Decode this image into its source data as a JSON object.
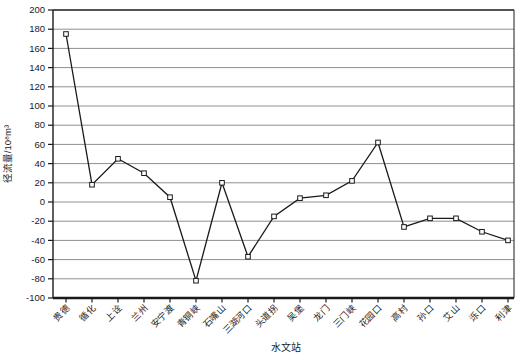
{
  "figure": {
    "background": "#ffffff"
  },
  "chart_data": {
    "type": "line",
    "title": "",
    "xlabel": "水文站",
    "ylabel": "径流量/10⁸m³",
    "categories": [
      "贵德",
      "循化",
      "上诠",
      "兰州",
      "安宁渡",
      "青铜峡",
      "石嘴山",
      "三湖河口",
      "头道拐",
      "吴堡",
      "龙门",
      "三门峡",
      "花园口",
      "高村",
      "孙口",
      "艾山",
      "泺口",
      "利津"
    ],
    "values": [
      175,
      18,
      45,
      30,
      5,
      -82,
      20,
      -57,
      -15,
      4,
      7,
      22,
      62,
      -26,
      -17,
      -17,
      -31,
      -40
    ],
    "series_name": "径流量",
    "ylim": [
      -100,
      200
    ],
    "ytick_step": 20,
    "ytick_labels": [
      200,
      180,
      160,
      140,
      120,
      100,
      80,
      60,
      40,
      20,
      0,
      -20,
      -40,
      -60,
      -80,
      -100
    ],
    "grid": "horizontal",
    "legend": "none",
    "marker": "open-square",
    "colors": {
      "line": "#1a1a1a",
      "marker_fill": "#ffffff",
      "marker_stroke": "#1a1a1a",
      "grid": "#8f8f8f",
      "axis": "#1a1a1a",
      "text": "#1a1a1a"
    }
  }
}
